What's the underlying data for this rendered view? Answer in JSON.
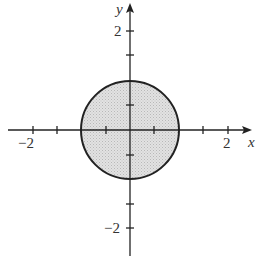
{
  "diagram": {
    "type": "region-plot",
    "region": {
      "shape": "disk",
      "center": [
        0,
        0
      ],
      "radius": 1,
      "fill": "#d8d8d8",
      "stroke": "#222222"
    },
    "axes": {
      "x_label": "x",
      "y_label": "y",
      "x_range": [
        -2.5,
        2.5
      ],
      "y_range": [
        -2.5,
        2.5
      ],
      "tick_step": 0.5,
      "x_tick_labels": [
        {
          "value": -2,
          "text": "−2"
        },
        {
          "value": 2,
          "text": "2"
        }
      ],
      "y_tick_labels": [
        {
          "value": 2,
          "text": "2"
        },
        {
          "value": -2,
          "text": "−2"
        }
      ]
    }
  }
}
